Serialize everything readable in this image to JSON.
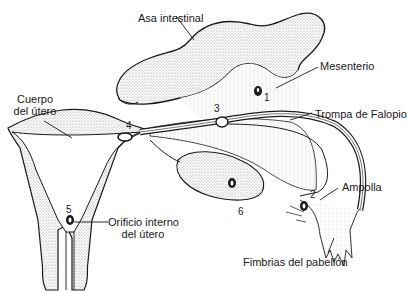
{
  "diagram": {
    "type": "anatomical-illustration",
    "labels": {
      "asa_intestinal": "Asa intestinal",
      "mesenterio": "Mesenterio",
      "trompa": "Trompa de Falopio",
      "ampolla": "Ampolla",
      "fimbrias": "Fimbrias del pabellón",
      "cuerpo_line1": "Cuerpo",
      "cuerpo_line2": "del útero",
      "orificio_line1": "Orificio interno",
      "orificio_line2": "del útero"
    },
    "markers": {
      "m1": "1",
      "m2": "2",
      "m3": "3",
      "m4": "4",
      "m5": "5",
      "m6": "6"
    },
    "colors": {
      "ink": "#1a1a1a",
      "stipple": "#9a9a9a",
      "background": "#ffffff"
    }
  }
}
